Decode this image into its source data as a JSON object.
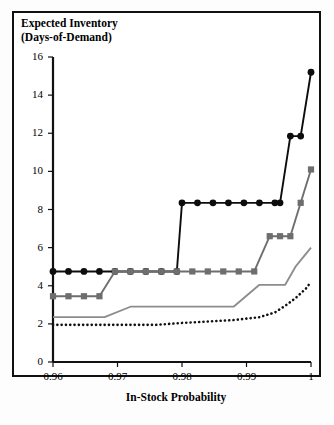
{
  "chart_data": {
    "type": "line",
    "title_line1": "Expected Inventory",
    "title_line2": "(Days-of-Demand)",
    "xlabel": "In-Stock Probability",
    "ylabel": "Expected Inventory (Days-of-Demand)",
    "xlim": [
      0.96,
      1.0
    ],
    "ylim": [
      0,
      16
    ],
    "xticks": [
      0.96,
      0.97,
      0.98,
      0.99,
      1
    ],
    "xtick_labels": [
      "0.96",
      "0.97",
      "0.98",
      "0.99",
      "1"
    ],
    "yticks": [
      0,
      2,
      4,
      6,
      8,
      10,
      12,
      14,
      16
    ],
    "ytick_labels": [
      "0",
      "2",
      "4",
      "6",
      "8",
      "10",
      "12",
      "14",
      "16"
    ],
    "grid": false,
    "legend": "none",
    "colors": {
      "black_circle": "#0d0d0d",
      "gray_square": "#6e6e6e",
      "gray_solid": "#8c8c8c",
      "black_dotted": "#111111",
      "frame": "#111111",
      "background": "#ffffff"
    },
    "series": [
      {
        "name": "black-circle-series",
        "style": "solid-with-circle-markers",
        "color": "#0d0d0d",
        "markers": true,
        "marker_shape": "circle",
        "x": [
          0.96,
          0.9624,
          0.9648,
          0.9672,
          0.9696,
          0.972,
          0.9744,
          0.9768,
          0.9792,
          0.98,
          0.9824,
          0.9848,
          0.9872,
          0.9896,
          0.992,
          0.9944,
          0.9952,
          0.9968,
          0.9984,
          1.0
        ],
        "y": [
          4.75,
          4.75,
          4.75,
          4.75,
          4.75,
          4.75,
          4.75,
          4.75,
          4.75,
          8.35,
          8.35,
          8.35,
          8.35,
          8.35,
          8.35,
          8.35,
          8.35,
          11.85,
          11.85,
          15.2
        ]
      },
      {
        "name": "gray-square-series",
        "style": "solid-with-square-markers",
        "color": "#6e6e6e",
        "markers": true,
        "marker_shape": "square",
        "x": [
          0.96,
          0.9624,
          0.9648,
          0.9672,
          0.9696,
          0.972,
          0.9744,
          0.9768,
          0.9792,
          0.9816,
          0.984,
          0.9864,
          0.9888,
          0.9912,
          0.9936,
          0.9952,
          0.9968,
          0.9984,
          1.0
        ],
        "y": [
          3.45,
          3.45,
          3.45,
          3.45,
          4.75,
          4.75,
          4.75,
          4.75,
          4.75,
          4.75,
          4.75,
          4.75,
          4.75,
          4.75,
          6.6,
          6.6,
          6.6,
          8.35,
          10.1
        ]
      },
      {
        "name": "gray-solid-line-series",
        "style": "solid",
        "color": "#8c8c8c",
        "markers": false,
        "x": [
          0.96,
          0.968,
          0.972,
          0.976,
          0.988,
          0.992,
          0.996,
          0.9976,
          1.0
        ],
        "y": [
          2.35,
          2.35,
          2.9,
          2.9,
          2.9,
          4.05,
          4.05,
          5.0,
          6.0
        ]
      },
      {
        "name": "black-dotted-line-series",
        "style": "dotted",
        "color": "#111111",
        "markers": false,
        "x": [
          0.96,
          0.976,
          0.98,
          0.988,
          0.992,
          0.9944,
          0.996,
          0.9976,
          0.9992,
          1.0
        ],
        "y": [
          1.95,
          1.95,
          2.05,
          2.2,
          2.35,
          2.6,
          2.95,
          3.35,
          3.85,
          4.2
        ]
      }
    ]
  }
}
